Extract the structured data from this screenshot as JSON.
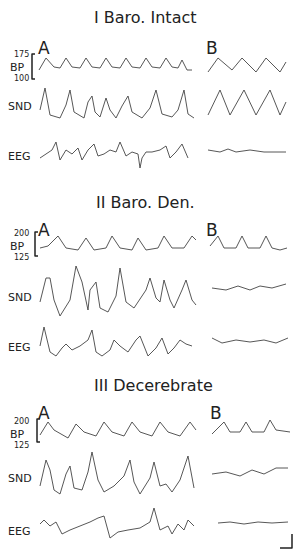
{
  "sections": [
    {
      "title": "I Baro. Intact",
      "panel_a": "A",
      "panel_b": "B",
      "bp_top": "175",
      "bp_bottom": "100"
    },
    {
      "title": "II Baro. Den.",
      "panel_a": "A",
      "panel_b": "B",
      "bp_top": "200",
      "bp_bottom": "125"
    },
    {
      "title": "III Decerebrate",
      "panel_a": "A",
      "panel_b": "B",
      "bp_top": "200",
      "bp_bottom": "125"
    }
  ],
  "labels": {
    "bp": "BP",
    "snd": "SND",
    "eeg": "EEG"
  }
}
